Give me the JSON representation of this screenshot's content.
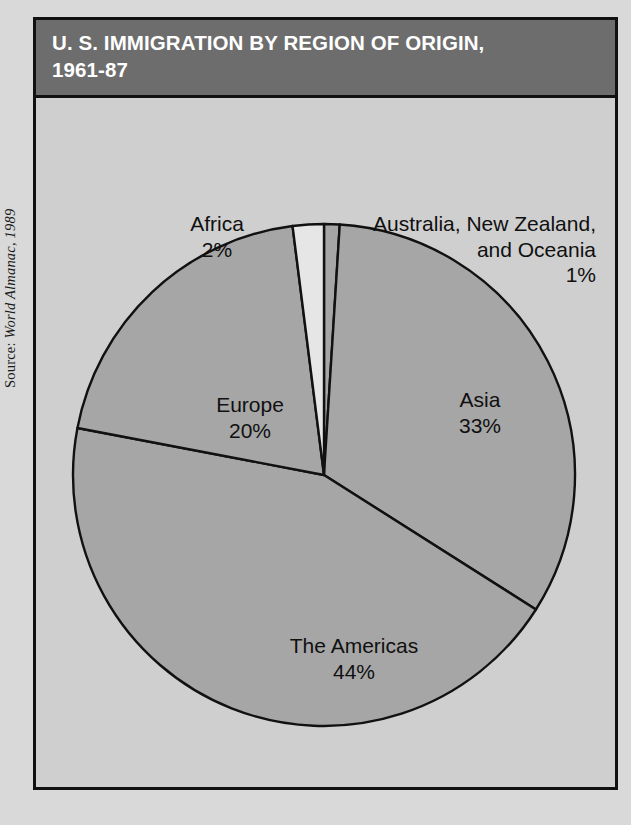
{
  "source_credit": {
    "prefix": "Source: ",
    "publication": "World Almanac, 1989"
  },
  "header": {
    "title_line1": "U. S. IMMIGRATION BY REGION OF ORIGIN,",
    "title_line2": "1961-87",
    "bar_color": "#6d6d6d",
    "text_color": "#ffffff"
  },
  "colors": {
    "page_background": "#d9d9d9",
    "panel_background": "#cfcfcf",
    "slice_fill": "#a6a6a6",
    "slice_highlight_fill": "#e6e6e6",
    "outline": "#111111"
  },
  "chart_data": {
    "type": "pie",
    "title": "U. S. IMMIGRATION BY REGION OF ORIGIN, 1961-87",
    "xlabel": "",
    "ylabel": "",
    "units": "percent",
    "total": 100,
    "legend_position": "none",
    "grid": false,
    "categories": [
      "The Americas",
      "Asia",
      "Europe",
      "Africa",
      "Australia, New Zealand, and Oceania"
    ],
    "values": [
      44,
      33,
      20,
      2,
      1
    ],
    "slices": [
      {
        "name": "australia",
        "label": "Australia, New Zealand,",
        "label_line2": "and Oceania",
        "percent_text": "1%",
        "value": 1,
        "fill": "#a6a6a6",
        "start_deg": 0,
        "sweep_deg": 3.6
      },
      {
        "name": "asia",
        "label": "Asia",
        "percent_text": "33%",
        "value": 33,
        "fill": "#a6a6a6",
        "start_deg": 3.6,
        "sweep_deg": 118.8
      },
      {
        "name": "americas",
        "label": "The Americas",
        "percent_text": "44%",
        "value": 44,
        "fill": "#a6a6a6",
        "start_deg": 122.4,
        "sweep_deg": 158.4
      },
      {
        "name": "europe",
        "label": "Europe",
        "percent_text": "20%",
        "value": 20,
        "fill": "#a6a6a6",
        "start_deg": 280.8,
        "sweep_deg": 72.0
      },
      {
        "name": "africa",
        "label": "Africa",
        "percent_text": "2%",
        "value": 2,
        "fill": "#e6e6e6",
        "start_deg": 352.8,
        "sweep_deg": 7.2
      }
    ]
  }
}
